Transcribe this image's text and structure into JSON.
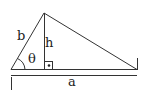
{
  "diagram": {
    "labels": {
      "side_b": "b",
      "height_h": "h",
      "angle_theta": "θ",
      "base_a": "a",
      "right_angle_dot": "•"
    },
    "colors": {
      "stroke": "#333333",
      "text": "#222222",
      "background": "#ffffff"
    }
  }
}
